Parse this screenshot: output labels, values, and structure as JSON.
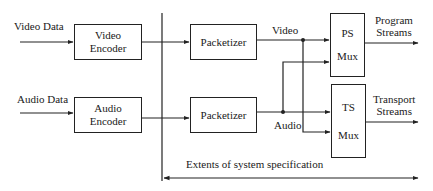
{
  "diagram": {
    "inputs": {
      "video_data": "Video Data",
      "audio_data": "Audio Data"
    },
    "blocks": {
      "video_encoder": [
        "Video",
        "Encoder"
      ],
      "audio_encoder": [
        "Audio",
        "Encoder"
      ],
      "video_packetizer": "Packetizer",
      "audio_packetizer": "Packetizer",
      "ps_mux": [
        "PS",
        "Mux"
      ],
      "ts_mux": [
        "TS",
        "Mux"
      ]
    },
    "stream_labels": {
      "video": "Video",
      "audio": "Audio"
    },
    "outputs": {
      "program_streams": [
        "Program",
        "Streams"
      ],
      "transport_streams": [
        "Transport",
        "Streams"
      ]
    },
    "extent_label": "Extents of system specification",
    "colors": {
      "line": "#222222",
      "background": "#ffffff"
    }
  }
}
